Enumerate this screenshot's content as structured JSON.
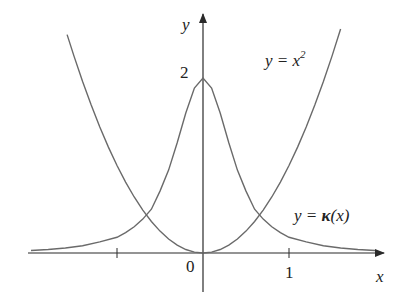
{
  "chart_data": {
    "type": "line",
    "title": "",
    "xlabel": "x",
    "ylabel": "y",
    "xlim": [
      -2.0,
      2.3
    ],
    "ylim": [
      -0.4,
      2.7
    ],
    "x_ticks": [
      {
        "value": -1,
        "label": ""
      },
      {
        "value": 0,
        "label": "0"
      },
      {
        "value": 1,
        "label": "1"
      }
    ],
    "y_ticks": [
      {
        "value": 2,
        "label": "2"
      }
    ],
    "grid": false,
    "legend": "inline annotations",
    "series": [
      {
        "name": "y = x^2",
        "label_text": "y = x",
        "label_sup": "2",
        "formula": "x^2",
        "x": [
          -1.58,
          -1.5,
          -1.4,
          -1.3,
          -1.2,
          -1.1,
          -1.0,
          -0.9,
          -0.8,
          -0.7,
          -0.6,
          -0.5,
          -0.4,
          -0.3,
          -0.2,
          -0.1,
          0.0,
          0.1,
          0.2,
          0.3,
          0.4,
          0.5,
          0.6,
          0.7,
          0.8,
          0.9,
          1.0,
          1.1,
          1.2,
          1.3,
          1.4,
          1.5,
          1.6
        ],
        "values": [
          2.496,
          2.25,
          1.96,
          1.69,
          1.44,
          1.21,
          1.0,
          0.81,
          0.64,
          0.49,
          0.36,
          0.25,
          0.16,
          0.09,
          0.04,
          0.01,
          0.0,
          0.01,
          0.04,
          0.09,
          0.16,
          0.25,
          0.36,
          0.49,
          0.64,
          0.81,
          1.0,
          1.21,
          1.44,
          1.69,
          1.96,
          2.25,
          2.56
        ]
      },
      {
        "name": "y = κ(x)",
        "label_text": "y = ",
        "label_kappa": "κ",
        "label_arg": "(x)",
        "formula": "2/(1+4x^2)^(3/2)",
        "x": [
          -2.0,
          -1.8,
          -1.6,
          -1.4,
          -1.2,
          -1.0,
          -0.9,
          -0.8,
          -0.7,
          -0.6,
          -0.5,
          -0.4,
          -0.3,
          -0.2,
          -0.1,
          0.0,
          0.1,
          0.2,
          0.3,
          0.4,
          0.5,
          0.6,
          0.7,
          0.8,
          0.9,
          1.0,
          1.2,
          1.4,
          1.6,
          1.8,
          2.0
        ],
        "values": [
          0.029,
          0.04,
          0.057,
          0.084,
          0.127,
          0.179,
          0.232,
          0.299,
          0.388,
          0.501,
          0.707,
          0.947,
          1.261,
          1.6,
          1.886,
          2.0,
          1.886,
          1.6,
          1.261,
          0.947,
          0.707,
          0.501,
          0.388,
          0.299,
          0.232,
          0.179,
          0.127,
          0.084,
          0.057,
          0.04,
          0.029
        ]
      }
    ],
    "annotations": [
      {
        "text": "y = x²",
        "near": [
          1.15,
          2.45
        ]
      },
      {
        "text": "y = κ(x)",
        "near": [
          1.2,
          0.5
        ]
      }
    ]
  },
  "labels": {
    "x_axis": "x",
    "y_axis": "y",
    "origin": "0",
    "tick_1": "1",
    "tick_2": "2",
    "parabola_prefix": "y = x",
    "parabola_sup": "2",
    "kappa_prefix": "y = ",
    "kappa_symbol": "κ",
    "kappa_arg": "(x)"
  },
  "colors": {
    "axis": "#2a2a2a",
    "curve": "#6a6a6a",
    "text": "#222222"
  }
}
